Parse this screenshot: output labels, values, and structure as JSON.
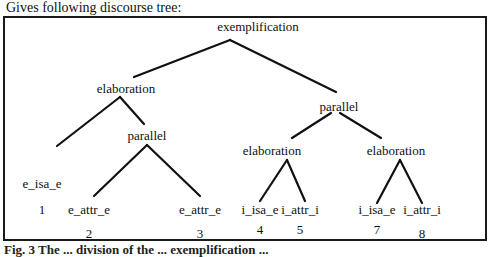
{
  "heading": "Gives following discourse tree:",
  "tree": {
    "nodes": [
      {
        "id": "root",
        "label": "exemplification",
        "number": null
      },
      {
        "id": "elab1",
        "label": "elaboration",
        "number": null
      },
      {
        "id": "par1",
        "label": "parallel",
        "number": null
      },
      {
        "id": "par2",
        "label": "parallel",
        "number": null
      },
      {
        "id": "elab2",
        "label": "elaboration",
        "number": null
      },
      {
        "id": "elab3",
        "label": "elaboration",
        "number": null
      },
      {
        "id": "leaf1",
        "label": "e_isa_e",
        "number": "1"
      },
      {
        "id": "leaf2",
        "label": "e_attr_e",
        "number": "2"
      },
      {
        "id": "leaf3",
        "label": "e_attr_e",
        "number": "3"
      },
      {
        "id": "leaf4",
        "label": "i_isa_e",
        "number": "4"
      },
      {
        "id": "leaf5",
        "label": "i_attr_i",
        "number": "5"
      },
      {
        "id": "leaf7",
        "label": "i_isa_e",
        "number": "7"
      },
      {
        "id": "leaf8",
        "label": "i_attr_i",
        "number": "8"
      }
    ],
    "edges": [
      [
        "root",
        "elab1"
      ],
      [
        "root",
        "par2"
      ],
      [
        "elab1",
        "leaf1"
      ],
      [
        "elab1",
        "par1"
      ],
      [
        "par1",
        "leaf2"
      ],
      [
        "par1",
        "leaf3"
      ],
      [
        "par2",
        "elab2"
      ],
      [
        "par2",
        "elab3"
      ],
      [
        "elab2",
        "leaf4"
      ],
      [
        "elab2",
        "leaf5"
      ],
      [
        "elab3",
        "leaf7"
      ],
      [
        "elab3",
        "leaf8"
      ]
    ]
  },
  "caption": "Fig. 3  The ... division of the ... exemplification ..."
}
